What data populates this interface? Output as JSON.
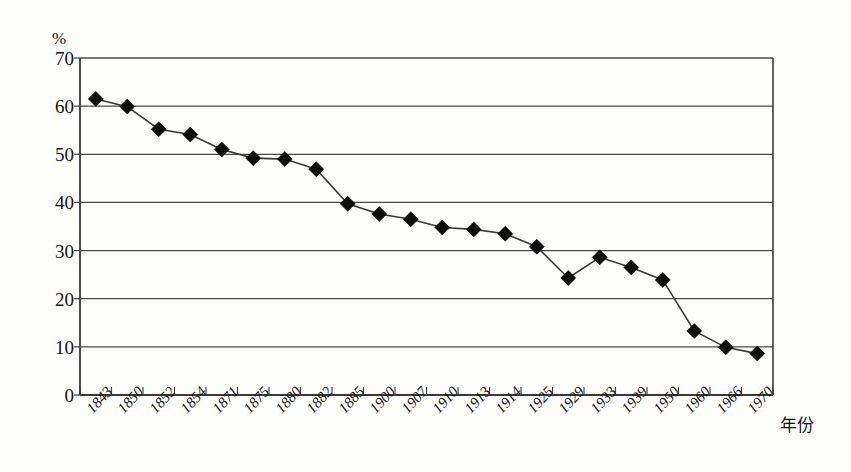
{
  "figure": {
    "y_unit_label": "%",
    "x_axis_title": "年份"
  },
  "chart_data": {
    "type": "line",
    "title": "",
    "subtitle": "",
    "xlabel": "年份",
    "ylabel": "%",
    "ylim": [
      0,
      70
    ],
    "ytick_labels": [
      "0",
      "10",
      "20",
      "30",
      "40",
      "50",
      "60",
      "70"
    ],
    "yticks": [
      0,
      10,
      20,
      30,
      40,
      50,
      60,
      70
    ],
    "grid": true,
    "grid_axis": "y",
    "legend": false,
    "legend_position": "none",
    "marker": "diamond",
    "marker_color": "#0d0d0d",
    "line_color": "#3a3a3a",
    "categories": [
      "1843",
      "1850",
      "1852",
      "1854",
      "1871",
      "1875",
      "1880",
      "1882",
      "1885",
      "1900",
      "1907",
      "1910",
      "1913",
      "1914",
      "1925",
      "1929",
      "1933",
      "1939",
      "1950",
      "1960",
      "1966",
      "1970"
    ],
    "values": [
      61.5,
      59.9,
      55.2,
      54.1,
      51.0,
      49.2,
      49.0,
      46.9,
      39.7,
      37.6,
      36.5,
      34.8,
      34.4,
      33.5,
      30.8,
      24.3,
      28.6,
      26.5,
      23.9,
      13.3,
      9.9,
      8.6
    ]
  }
}
